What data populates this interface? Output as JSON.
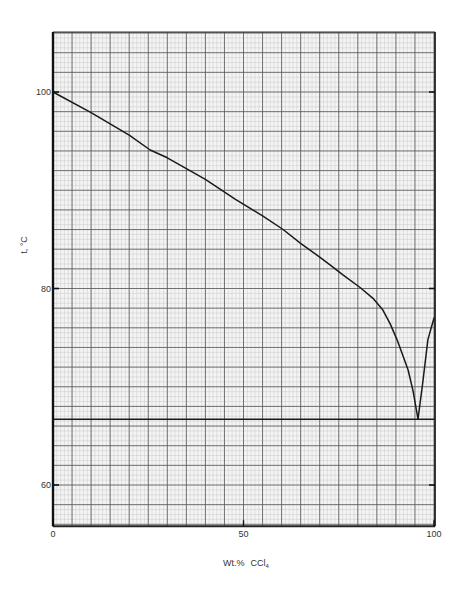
{
  "chart_data": {
    "type": "line",
    "title": "",
    "xlabel": "Wt.% CCl4",
    "xlabel_main": "Wt.%",
    "xlabel_chem": "CCl",
    "xlabel_sub": "4",
    "ylabel": "t, °C",
    "xlim": [
      0,
      100
    ],
    "ylim": [
      55.8,
      106.1
    ],
    "x_ticks": [
      0,
      50,
      100
    ],
    "x_tick_labels": [
      "0",
      "50",
      "100"
    ],
    "y_ticks": [
      60,
      80,
      100
    ],
    "y_tick_labels": [
      "60",
      "80",
      "100"
    ],
    "grid": {
      "on": true,
      "major_x_step": 5,
      "minor_x_step": 1,
      "major_y_step": 2,
      "minor_y_step": 0.5,
      "major_color": "#555555",
      "minor_color": "#c8c8c8"
    },
    "legend": null,
    "series": [
      {
        "name": "Liquidus (water-rich branch)",
        "x": [
          0,
          10,
          20,
          25.5,
          30,
          40,
          47.8,
          55,
          60.4,
          65,
          70,
          72.7,
          76,
          80.6,
          84,
          86.6,
          88.5,
          90.3,
          92,
          93.2,
          94.5,
          95.8
        ],
        "y": [
          100,
          97.9,
          95.6,
          94.1,
          93.3,
          91.1,
          89.1,
          87.4,
          86.0,
          84.6,
          83.2,
          82.4,
          81.4,
          80.1,
          79.0,
          77.8,
          76.4,
          74.8,
          73.0,
          71.7,
          69.6,
          66.7
        ]
      },
      {
        "name": "Liquidus (CCl4-rich branch)",
        "x": [
          95.8,
          97,
          98.4,
          100
        ],
        "y": [
          66.7,
          70.3,
          74.8,
          77.0
        ]
      },
      {
        "name": "Eutectic isotherm",
        "x": [
          0,
          100
        ],
        "y": [
          66.7,
          66.7
        ]
      }
    ],
    "annotations": [
      {
        "type": "eutectic_point",
        "x": 95.8,
        "y": 66.7
      }
    ]
  }
}
